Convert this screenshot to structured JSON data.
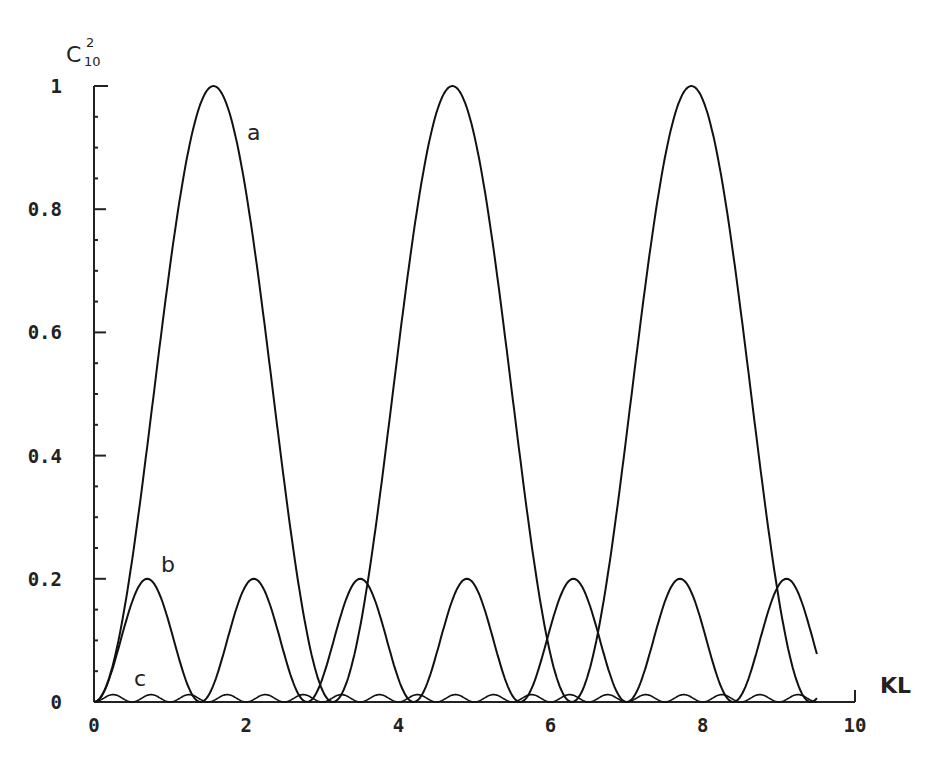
{
  "chart_data": {
    "type": "line",
    "title": "",
    "xlabel": "KL",
    "ylabel": "C₁₀²",
    "ylabel_main": "C",
    "ylabel_sup": "2",
    "ylabel_sub": "10",
    "xlim": [
      0,
      10
    ],
    "ylim": [
      0,
      1
    ],
    "x_ticks": [
      0,
      2,
      4,
      6,
      8,
      10
    ],
    "x_tick_labels": [
      "0",
      "2",
      "4",
      "6",
      "8",
      "10"
    ],
    "y_ticks": [
      0,
      0.2,
      0.4,
      0.6,
      0.8,
      1
    ],
    "y_tick_labels": [
      "0",
      "0.2",
      "0.4",
      "0.6",
      "0.8",
      "1"
    ],
    "grid": false,
    "legend": "inline labels",
    "series": [
      {
        "name": "a",
        "description": "sin^2(KL), amplitude 1, period ~3.14",
        "amplitude": 1.0,
        "period": 3.14,
        "x_end": 9.5,
        "peaks_x": [
          1.5,
          4.7,
          7.8
        ],
        "x": [
          0,
          0.5,
          1.0,
          1.5,
          2.0,
          2.5,
          3.0,
          3.14,
          3.5,
          4.0,
          4.7,
          5.5,
          6.0,
          6.28,
          7.0,
          7.8,
          8.5,
          9.0,
          9.42,
          9.5
        ],
        "values": [
          0,
          0.23,
          0.71,
          1.0,
          0.83,
          0.36,
          0.02,
          0,
          0.12,
          0.57,
          1.0,
          0.5,
          0.08,
          0,
          0.43,
          1.0,
          0.6,
          0.17,
          0,
          0.01
        ]
      },
      {
        "name": "b",
        "description": "0.2*sin^2, amplitude 0.2, period ~1.4",
        "amplitude": 0.2,
        "period": 1.4,
        "x_end": 9.5,
        "peaks_x": [
          0.7,
          2.1,
          3.5,
          4.9,
          6.3,
          7.7,
          9.15
        ],
        "x": [
          0,
          0.7,
          1.4,
          2.1,
          2.8,
          3.5,
          4.2,
          4.9,
          5.6,
          6.3,
          7.0,
          7.7,
          8.4,
          9.15,
          9.5
        ],
        "values": [
          0,
          0.2,
          0,
          0.2,
          0,
          0.2,
          0,
          0.2,
          0,
          0.2,
          0,
          0.2,
          0,
          0.2,
          0.12
        ]
      },
      {
        "name": "c",
        "description": "small oscillation, amplitude ~0.012, period ~0.5",
        "amplitude": 0.012,
        "period": 0.5,
        "x_end": 9.5
      }
    ],
    "annotations": [
      {
        "text": "a",
        "x": 1.95,
        "y": 0.95
      },
      {
        "text": "b",
        "x": 0.85,
        "y": 0.21
      },
      {
        "text": "c",
        "x": 0.55,
        "y": 0.01
      }
    ]
  }
}
